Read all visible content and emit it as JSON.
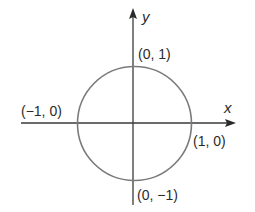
{
  "diagram": {
    "type": "unit-circle",
    "axes": {
      "x_label": "x",
      "y_label": "y"
    },
    "points": [
      {
        "id": "top",
        "label": "(0, 1)",
        "x": 0,
        "y": 1
      },
      {
        "id": "left",
        "label": "(−1, 0)",
        "x": -1,
        "y": 0
      },
      {
        "id": "right",
        "label": "(1, 0)",
        "x": 1,
        "y": 0
      },
      {
        "id": "bottom",
        "label": "(0, −1)",
        "x": 0,
        "y": -1
      }
    ],
    "colors": {
      "axis": "#3a3a3a",
      "circle": "#7a7a7a",
      "text": "#2b2b2b",
      "background": "#ffffff"
    }
  }
}
